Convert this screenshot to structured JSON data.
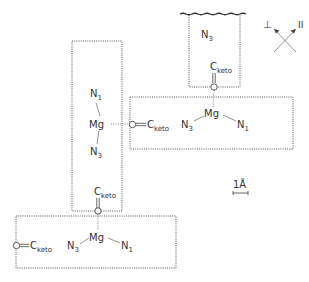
{
  "diagram": {
    "type": "molecular-arrangement",
    "atoms": {
      "mg": "Mg",
      "n1": "N",
      "n1_sub": "1",
      "n3": "N",
      "n3_sub": "3",
      "o": "O",
      "c": "C",
      "c_sub": "keto"
    },
    "orientation": {
      "perpendicular": "⊥",
      "parallel": "II"
    },
    "scale_bar": {
      "label": "1Å"
    },
    "units": [
      {
        "id": "top",
        "labels": [
          "N3",
          "Cketo",
          "O"
        ]
      },
      {
        "id": "right",
        "labels": [
          "N3",
          "Mg",
          "N1"
        ]
      },
      {
        "id": "left",
        "labels": [
          "N1",
          "Mg",
          "N3",
          "O",
          "Cketo"
        ]
      },
      {
        "id": "bottom",
        "labels": [
          "O",
          "Cketo",
          "N3",
          "Mg",
          "N1"
        ]
      }
    ]
  }
}
